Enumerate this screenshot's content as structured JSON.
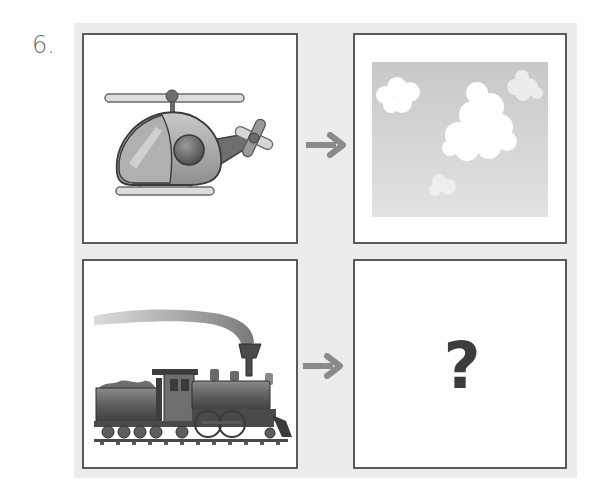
{
  "question": {
    "number_label": "6.",
    "unknown_symbol": "?"
  },
  "pairs": [
    {
      "source": {
        "icon": "helicopter-icon",
        "label": "helicopter"
      },
      "relation_icon": "arrow-right-icon",
      "target": {
        "icon": "sky-clouds-icon",
        "label": "sky with clouds"
      }
    },
    {
      "source": {
        "icon": "steam-train-icon",
        "label": "steam locomotive"
      },
      "relation_icon": "arrow-right-icon",
      "target": {
        "icon": "question-mark-icon",
        "label": "?"
      }
    }
  ],
  "colors": {
    "panel_bg": "#ececec",
    "frame_border": "#5a5a5a",
    "arrow": "#8a8a8a",
    "question_mark": "#3c3c3c",
    "number": "#6a6a6a"
  }
}
